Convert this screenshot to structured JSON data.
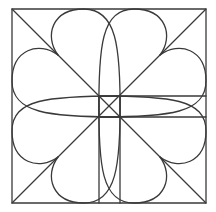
{
  "figure": {
    "stroke_color": "#3a3a3a",
    "background": "#ffffff",
    "outer_square": {
      "x": 12,
      "y": 9,
      "size": 194
    },
    "center": [
      109,
      106
    ],
    "inner_square": {
      "x": 99,
      "y": 96,
      "size": 21
    },
    "diagonal_points": [
      [
        58,
        55
      ],
      [
        160,
        55
      ],
      [
        58,
        157
      ],
      [
        160,
        157
      ]
    ],
    "petal_count": 8
  }
}
